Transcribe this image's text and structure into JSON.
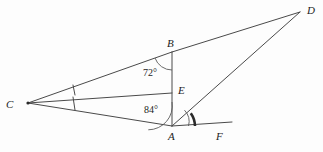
{
  "figure": {
    "background_color": "#fdfdfd",
    "stroke_color": "#4a4a4a",
    "stroke_color_dark": "#2b2b2b",
    "text_color": "#1c1c1c",
    "vertices": [
      {
        "id": "C",
        "label": "C",
        "x": 28,
        "y": 103,
        "label_x": 6,
        "label_y": 99
      },
      {
        "id": "B",
        "label": "B",
        "x": 172,
        "y": 52,
        "label_x": 167,
        "label_y": 38
      },
      {
        "id": "E",
        "label": "E",
        "x": 172,
        "y": 93,
        "label_x": 178,
        "label_y": 85
      },
      {
        "id": "A",
        "label": "A",
        "x": 172,
        "y": 126,
        "label_x": 168,
        "label_y": 131
      },
      {
        "id": "D",
        "label": "D",
        "x": 300,
        "y": 12,
        "label_x": 307,
        "label_y": 5
      },
      {
        "id": "F",
        "label": "F",
        "x": 232,
        "y": 122,
        "label_x": 216,
        "label_y": 131
      }
    ],
    "segments": [
      {
        "name": "segment-C-B",
        "from": "C",
        "to": "B"
      },
      {
        "name": "segment-B-D",
        "from": "B",
        "to": "D"
      },
      {
        "name": "segment-C-E",
        "from": "C",
        "to": "E"
      },
      {
        "name": "segment-C-A",
        "from": "C",
        "to": "A"
      },
      {
        "name": "segment-A-F",
        "from": "A",
        "to": "F"
      },
      {
        "name": "segment-A-D",
        "from": "A",
        "to": "D"
      },
      {
        "name": "segment-B-A",
        "from": "B",
        "to": "A"
      }
    ],
    "angles": [
      {
        "name": "angle-at-B",
        "value": "72°",
        "vertex": "B",
        "label_x": 143,
        "label_y": 68,
        "arc_radius": 18
      },
      {
        "name": "angle-at-A",
        "value": "84°",
        "vertex": "A",
        "label_x": 144,
        "label_y": 105,
        "arc_radius": 24
      }
    ],
    "marks": {
      "bisector_ticks_at_C": 2,
      "emphasized_arc_at_A": "angle-D-A-F"
    }
  }
}
